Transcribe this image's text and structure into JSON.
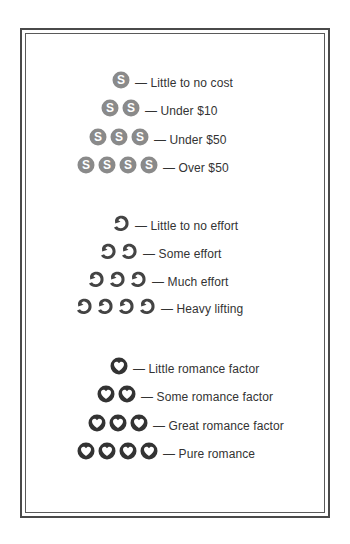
{
  "legend": {
    "cost": {
      "icon": "dollar-coin-icon",
      "icon_color": "#8a8a8a",
      "rows": [
        {
          "count": 1,
          "label": "— Little to no cost"
        },
        {
          "count": 2,
          "label": "— Under $10"
        },
        {
          "count": 3,
          "label": "— Under $50"
        },
        {
          "count": 4,
          "label": "— Over $50"
        }
      ]
    },
    "effort": {
      "icon": "flexed-arm-icon",
      "icon_color": "#444444",
      "rows": [
        {
          "count": 1,
          "label": "— Little to no effort"
        },
        {
          "count": 2,
          "label": "— Some effort"
        },
        {
          "count": 3,
          "label": "— Much effort"
        },
        {
          "count": 4,
          "label": "— Heavy lifting"
        }
      ]
    },
    "romance": {
      "icon": "heart-circle-icon",
      "icon_color": "#333333",
      "rows": [
        {
          "count": 1,
          "label": "— Little romance factor"
        },
        {
          "count": 2,
          "label": "— Some romance factor"
        },
        {
          "count": 3,
          "label": "— Great romance factor"
        },
        {
          "count": 4,
          "label": "— Pure romance"
        }
      ]
    }
  }
}
